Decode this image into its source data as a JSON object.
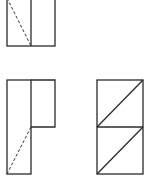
{
  "diagram": {
    "stroke_color": "#2a2a2a",
    "background": "#ffffff",
    "views": [
      {
        "name": "top-view",
        "position": "top-left",
        "outline": {
          "x": 7,
          "y": -2,
          "w": 48,
          "h": 48
        },
        "divider_x": 31,
        "hidden_line": {
          "x1": 7,
          "y1": -2,
          "x2": 31,
          "y2": 46
        }
      },
      {
        "name": "front-view",
        "position": "bottom-left",
        "tall_part": {
          "x": 7,
          "y": 80,
          "w": 24,
          "h": 94
        },
        "side_part": {
          "x": 31,
          "y": 80,
          "w": 24,
          "h": 47
        },
        "hidden_line": {
          "x1": 31,
          "y1": 127,
          "x2": 7,
          "y2": 174
        }
      },
      {
        "name": "side-view",
        "position": "bottom-right",
        "outline": {
          "x": 97,
          "y": 80,
          "w": 46,
          "h": 94
        },
        "divider_y": 127,
        "diagonals": [
          {
            "x1": 97,
            "y1": 127,
            "x2": 143,
            "y2": 80
          },
          {
            "x1": 97,
            "y1": 174,
            "x2": 143,
            "y2": 127
          }
        ]
      }
    ]
  }
}
